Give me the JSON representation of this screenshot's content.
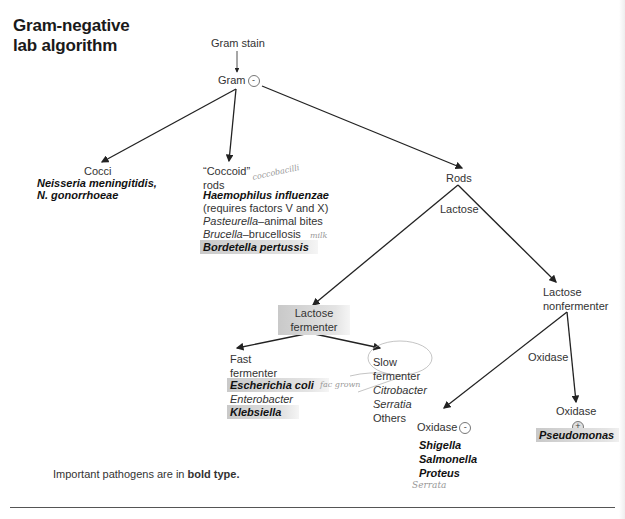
{
  "title": {
    "line1": "Gram-negative",
    "line2": "lab algorithm"
  },
  "nodes": {
    "gram_stain": "Gram stain",
    "gram_neg": {
      "label": "Gram",
      "sign": "-"
    },
    "cocci": {
      "label": "Cocci",
      "organisms": [
        "Neisseria meningitidis,",
        "N. gonorrhoeae"
      ]
    },
    "coccoid": {
      "label_line1": "“Coccoid”",
      "label_line2": "rods",
      "handnote": "coccobacilli",
      "organism_bold": "Haemophilus influenzae",
      "note": "(requires factors V and X)",
      "pasteurella": {
        "genus": "Pasteurella",
        "desc": "–animal bites"
      },
      "brucella": {
        "genus": "Brucella",
        "desc": "–brucellosis",
        "handnote": "milk"
      },
      "bordetella": "Bordetella pertussis"
    },
    "rods": "Rods",
    "lactose": "Lactose",
    "lactose_fermenter": {
      "line1": "Lactose",
      "line2": "fermenter"
    },
    "lactose_nonfermenter": {
      "line1": "Lactose",
      "line2": "nonfermenter"
    },
    "fast": {
      "line1": "Fast",
      "line2": "fermenter",
      "organisms": [
        "Escherichia coli",
        "Enterobacter",
        "Klebsiella"
      ],
      "handnote": "fac grown"
    },
    "slow": {
      "line1": "Slow",
      "line2": "fermenter",
      "organisms": [
        "Citrobacter",
        "Serratia",
        "Others"
      ]
    },
    "oxidase_edge": "Oxidase",
    "oxidase_neg": {
      "label": "Oxidase",
      "sign": "-",
      "organisms": [
        "Shigella",
        "Salmonella",
        "Proteus"
      ],
      "handnote": "Serrata"
    },
    "oxidase_pos": {
      "label": "Oxidase",
      "sign": "+",
      "organism": "Pseudomonas"
    }
  },
  "footnote": {
    "prefix": "Important pathogens are in ",
    "bold": "bold type."
  }
}
